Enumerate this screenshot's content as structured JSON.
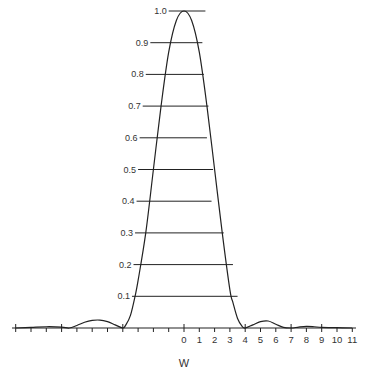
{
  "chart_data": {
    "type": "line",
    "title": "",
    "xlabel": "W",
    "ylabel": "",
    "xlim": [
      -11,
      11
    ],
    "ylim": [
      0,
      1.0
    ],
    "grid": false,
    "legend": null,
    "x_tick_labels": [
      "0",
      "1",
      "2",
      "3",
      "4",
      "5",
      "6",
      "7",
      "8",
      "9",
      "10",
      "11"
    ],
    "x_ticks": [
      -11,
      -10,
      -9,
      -8,
      -7,
      -6,
      -5,
      -4,
      -3,
      -2,
      -1,
      0,
      1,
      2,
      3,
      4,
      5,
      6,
      7,
      8,
      9,
      10,
      11
    ],
    "y_tick_labels": [
      "0.1",
      "0.2",
      "0.3",
      "0.4",
      "0.5",
      "0.6",
      "0.7",
      "0.8",
      "0.9",
      "1.0"
    ],
    "level_lines": [
      {
        "label": "1.0",
        "y": 1.0,
        "x_from": -1.0,
        "x_to": 1.4
      },
      {
        "label": "0.9",
        "y": 0.9,
        "x_from": -2.2,
        "x_to": 1.2
      },
      {
        "label": "0.8",
        "y": 0.8,
        "x_from": -2.5,
        "x_to": 1.3
      },
      {
        "label": "0.7",
        "y": 0.7,
        "x_from": -2.7,
        "x_to": 1.6
      },
      {
        "label": "0.6",
        "y": 0.6,
        "x_from": -2.9,
        "x_to": 1.5
      },
      {
        "label": "0.5",
        "y": 0.5,
        "x_from": -3.0,
        "x_to": 1.9
      },
      {
        "label": "0.4",
        "y": 0.4,
        "x_from": -3.1,
        "x_to": 1.8
      },
      {
        "label": "0.3",
        "y": 0.3,
        "x_from": -3.2,
        "x_to": 2.6
      },
      {
        "label": "0.2",
        "y": 0.2,
        "x_from": -3.3,
        "x_to": 3.2
      },
      {
        "label": "0.1",
        "y": 0.1,
        "x_from": -3.4,
        "x_to": 3.5
      }
    ],
    "series": [
      {
        "name": "intensity",
        "x": [
          -11,
          -10,
          -9,
          -8,
          -7.5,
          -7,
          -6.5,
          -6,
          -5.5,
          -5,
          -4.5,
          -4,
          -3.8,
          -3.5,
          -3.2,
          -3,
          -2.5,
          -2,
          -1.5,
          -1,
          -0.5,
          0,
          0.5,
          1,
          1.5,
          2,
          2.5,
          3,
          3.2,
          3.5,
          3.8,
          4,
          4.5,
          5,
          5.5,
          6,
          6.5,
          7,
          7.5,
          8,
          8.5,
          9,
          10,
          11
        ],
        "values": [
          0.0,
          0.002,
          0.004,
          0.003,
          0.0,
          0.008,
          0.018,
          0.024,
          0.025,
          0.02,
          0.01,
          0.0,
          0.01,
          0.04,
          0.1,
          0.15,
          0.3,
          0.5,
          0.7,
          0.87,
          0.97,
          1.0,
          0.97,
          0.87,
          0.7,
          0.5,
          0.3,
          0.12,
          0.08,
          0.03,
          0.005,
          0.0,
          0.01,
          0.02,
          0.022,
          0.012,
          0.002,
          0.0,
          0.003,
          0.005,
          0.004,
          0.002,
          0.001,
          0.0
        ]
      }
    ]
  }
}
